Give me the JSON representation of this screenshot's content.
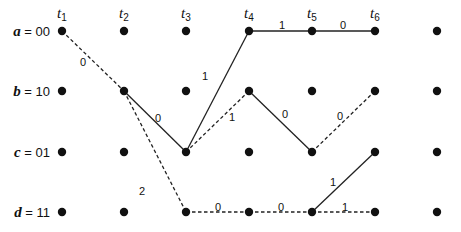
{
  "diagram": {
    "type": "trellis",
    "states": [
      {
        "id": "a",
        "var": "a",
        "code": "00",
        "y": 31
      },
      {
        "id": "b",
        "var": "b",
        "code": "10",
        "y": 91
      },
      {
        "id": "c",
        "var": "c",
        "code": "01",
        "y": 152
      },
      {
        "id": "d",
        "var": "d",
        "code": "11",
        "y": 212
      }
    ],
    "time_steps": [
      {
        "label": "t",
        "sub": "1",
        "x": 62
      },
      {
        "label": "t",
        "sub": "2",
        "x": 124
      },
      {
        "label": "t",
        "sub": "3",
        "x": 186
      },
      {
        "label": "t",
        "sub": "4",
        "x": 249
      },
      {
        "label": "t",
        "sub": "5",
        "x": 312
      },
      {
        "label": "t",
        "sub": "6",
        "x": 375
      },
      {
        "label": "",
        "sub": "",
        "x": 437
      }
    ],
    "edges": [
      {
        "from": [
          0,
          "a"
        ],
        "to": [
          1,
          "b"
        ],
        "style": "dashed",
        "label": "0"
      },
      {
        "from": [
          1,
          "b"
        ],
        "to": [
          2,
          "c"
        ],
        "style": "solid",
        "label": "0"
      },
      {
        "from": [
          1,
          "b"
        ],
        "to": [
          2,
          "d"
        ],
        "style": "dashed",
        "label": "2"
      },
      {
        "from": [
          2,
          "c"
        ],
        "to": [
          3,
          "a"
        ],
        "style": "solid",
        "label": "1"
      },
      {
        "from": [
          2,
          "c"
        ],
        "to": [
          3,
          "b"
        ],
        "style": "dashed",
        "label": "1"
      },
      {
        "from": [
          2,
          "d"
        ],
        "to": [
          3,
          "d"
        ],
        "style": "dashed",
        "label": "0"
      },
      {
        "from": [
          3,
          "a"
        ],
        "to": [
          4,
          "a"
        ],
        "style": "solid",
        "label": "1"
      },
      {
        "from": [
          3,
          "b"
        ],
        "to": [
          4,
          "c"
        ],
        "style": "solid",
        "label": "0"
      },
      {
        "from": [
          3,
          "d"
        ],
        "to": [
          4,
          "d"
        ],
        "style": "dashed",
        "label": "0"
      },
      {
        "from": [
          4,
          "a"
        ],
        "to": [
          5,
          "a"
        ],
        "style": "solid",
        "label": "0"
      },
      {
        "from": [
          4,
          "c"
        ],
        "to": [
          5,
          "b"
        ],
        "style": "dashed",
        "label": "0"
      },
      {
        "from": [
          4,
          "d"
        ],
        "to": [
          5,
          "c"
        ],
        "style": "solid",
        "label": "1"
      },
      {
        "from": [
          4,
          "d"
        ],
        "to": [
          5,
          "d"
        ],
        "style": "dashed",
        "label": "1"
      }
    ],
    "edge_label_positions": [
      {
        "x": 83,
        "y": 66
      },
      {
        "x": 158,
        "y": 122
      },
      {
        "x": 142,
        "y": 195
      },
      {
        "x": 205,
        "y": 80
      },
      {
        "x": 232,
        "y": 121
      },
      {
        "x": 218,
        "y": 211
      },
      {
        "x": 282,
        "y": 29
      },
      {
        "x": 285,
        "y": 118
      },
      {
        "x": 281,
        "y": 211
      },
      {
        "x": 343,
        "y": 29
      },
      {
        "x": 340,
        "y": 120
      },
      {
        "x": 333,
        "y": 186
      },
      {
        "x": 345,
        "y": 211
      }
    ]
  }
}
